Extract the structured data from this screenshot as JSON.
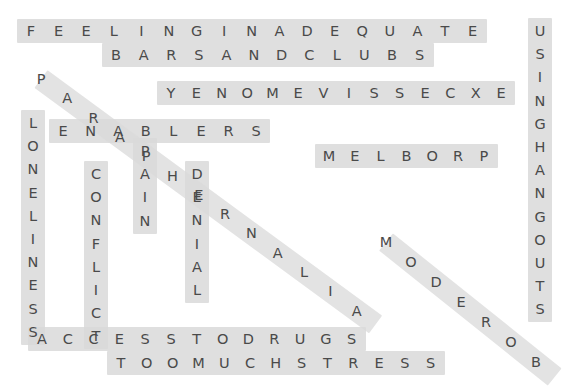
{
  "puzzle": {
    "type": "word-search",
    "width": 556,
    "height": 376,
    "background_color": "#ffffff",
    "highlight_color": "#d9d9d9",
    "letter_color": "#4a4a4a",
    "entries": [
      {
        "name": "feeling-inadequate",
        "text": "FEELINGINADEQUATE",
        "phrase": "FEELING INADEQUATE",
        "orientation": "horizontal",
        "direction": "forward",
        "x": 20,
        "y": 20,
        "step": 27.6,
        "count": 17
      },
      {
        "name": "bars-and-clubs",
        "text": "BARSANDCLUBS",
        "phrase": "BARS AND CLUBS",
        "orientation": "horizontal",
        "direction": "forward",
        "x": 105,
        "y": 44,
        "step": 27.6,
        "count": 12
      },
      {
        "name": "excessive-money-reversed",
        "text": "YENOMEVISSECXE",
        "phrase": "EXCESSIVE MONEY",
        "orientation": "horizontal",
        "direction": "reversed",
        "x": 160,
        "y": 82,
        "step": 25.4,
        "count": 14
      },
      {
        "name": "enablers",
        "text": "ENABLERS",
        "phrase": "ENABLERS",
        "orientation": "horizontal",
        "direction": "forward",
        "x": 52,
        "y": 120,
        "step": 27.6,
        "count": 8
      },
      {
        "name": "problem-reversed",
        "text": "MELBORP",
        "phrase": "PROBLEM",
        "orientation": "horizontal",
        "direction": "reversed",
        "x": 318,
        "y": 145,
        "step": 25.8,
        "count": 7
      },
      {
        "name": "access-to-drugs",
        "text": "ACCESSTODRUGS",
        "phrase": "ACCESS TO DRUGS",
        "orientation": "horizontal",
        "direction": "forward",
        "x": 31,
        "y": 328,
        "step": 25.8,
        "count": 13
      },
      {
        "name": "too-much-stress",
        "text": "TOOMUCHSTRESS",
        "phrase": "TOO MUCH STRESS",
        "orientation": "horizontal",
        "direction": "forward",
        "x": 110,
        "y": 352,
        "step": 25.8,
        "count": 13
      },
      {
        "name": "loneliness",
        "text": "LONELINESS",
        "phrase": "LONELINESS",
        "orientation": "vertical",
        "direction": "forward",
        "x": 22,
        "y": 112,
        "step": 23.2,
        "count": 10
      },
      {
        "name": "conflict",
        "text": "CONFLICT",
        "phrase": "CONFLICT",
        "orientation": "vertical",
        "direction": "forward",
        "x": 85,
        "y": 163,
        "step": 23.2,
        "count": 8
      },
      {
        "name": "pain",
        "text": "PAIN",
        "phrase": "PAIN",
        "orientation": "vertical",
        "direction": "forward",
        "x": 134,
        "y": 140,
        "step": 23.2,
        "count": 4
      },
      {
        "name": "denial",
        "text": "DENIAL",
        "phrase": "DENIAL",
        "orientation": "vertical",
        "direction": "forward",
        "x": 186,
        "y": 163,
        "step": 23.2,
        "count": 6
      },
      {
        "name": "using-hangouts",
        "text": "USINGHANGOUTS",
        "phrase": "USING HANGOUTS",
        "orientation": "vertical",
        "direction": "forward",
        "x": 529,
        "y": 20,
        "step": 23.2,
        "count": 13
      },
      {
        "name": "paraphernalia-diagonal",
        "text": "PARAPHERNALIA",
        "phrase": "PARAPHERNALIA",
        "orientation": "diagonal-down-right",
        "direction": "forward",
        "x": 30,
        "y": 68,
        "stepx": 26.3,
        "stepy": 19.3,
        "count": 13
      },
      {
        "name": "boredom-diagonal-reversed",
        "text": "MODEROB",
        "phrase": "BOREDOM",
        "orientation": "diagonal-down-right",
        "direction": "reversed",
        "x": 375,
        "y": 231,
        "stepx": 25.0,
        "stepy": 20.0,
        "count": 7
      }
    ]
  }
}
